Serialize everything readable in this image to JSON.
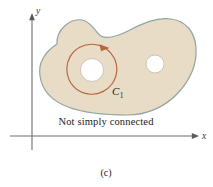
{
  "figure": {
    "background_color": "#ffffff",
    "width": 213,
    "height": 187,
    "caption": "Not simply connected",
    "subcaption": "(c)"
  },
  "axes": {
    "x_label": "x",
    "y_label": "y",
    "color": "#6e6e6e",
    "origin_x": 32,
    "origin_y": 136
  },
  "region": {
    "name": "not-simply-connected-region",
    "fill_color": "#e8dcc6",
    "stroke_color": "#8fa6a0",
    "holes": [
      {
        "name": "hole-left",
        "cx": 92,
        "cy": 70,
        "r": 11.5,
        "fill": "#ffffff"
      },
      {
        "name": "hole-right",
        "cx": 155,
        "cy": 64,
        "r": 9.0,
        "fill": "#ffffff"
      }
    ]
  },
  "curve": {
    "label_main": "C",
    "label_sub": "1",
    "color": "#b5653f",
    "cx": 93,
    "cy": 70,
    "r": 25,
    "orientation": "counterclockwise",
    "label_x": 112,
    "label_y": 95
  }
}
